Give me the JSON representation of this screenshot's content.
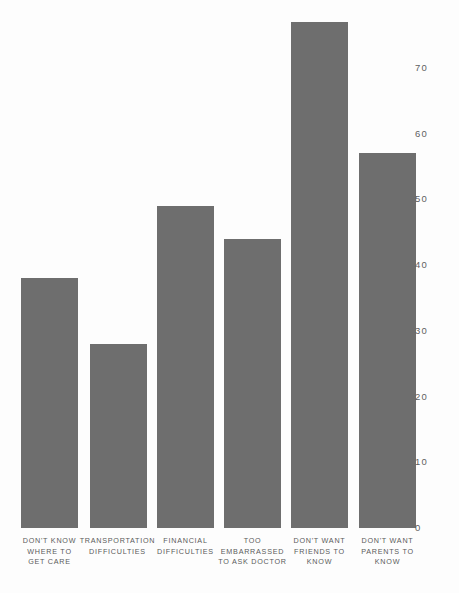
{
  "colors": {
    "bar": "#6e6e6e",
    "background": "#fdfdfd",
    "axis_text": "#5f5f5f",
    "category_text": "#5a5a5a"
  },
  "chart_data": {
    "type": "bar",
    "title": "",
    "subtitle": "",
    "xlabel": "",
    "ylabel": "",
    "ylim": [
      0,
      77
    ],
    "grid": false,
    "legend": null,
    "orientation": "vertical",
    "categories": [
      "DON'T KNOW WHERE TO GET CARE",
      "TRANSPORTATION DIFFICULTIES",
      "FINANCIAL DIFFICULTIES",
      "TOO EMBARRASSED TO ASK DOCTOR",
      "DON'T WANT FRIENDS TO KNOW",
      "DON'T WANT PARENTS TO KNOW"
    ],
    "category_label_lines": [
      [
        "DON'T KNOW",
        "WHERE TO",
        "GET CARE"
      ],
      [
        "TRANSPORTATION",
        "DIFFICULTIES"
      ],
      [
        "FINANCIAL",
        "DIFFICULTIES"
      ],
      [
        "TOO",
        "EMBARRASSED",
        "TO ASK DOCTOR"
      ],
      [
        "DON'T WANT",
        "FRIENDS TO",
        "KNOW"
      ],
      [
        "DON'T WANT",
        "PARENTS TO",
        "KNOW"
      ]
    ],
    "values": [
      38,
      28,
      49,
      44,
      77,
      57
    ],
    "y_ticks": [
      0,
      10,
      20,
      30,
      40,
      50,
      60,
      70
    ],
    "y_tick_labels": [
      "0",
      "10",
      "20",
      "30",
      "40",
      "50",
      "60",
      "70"
    ]
  }
}
